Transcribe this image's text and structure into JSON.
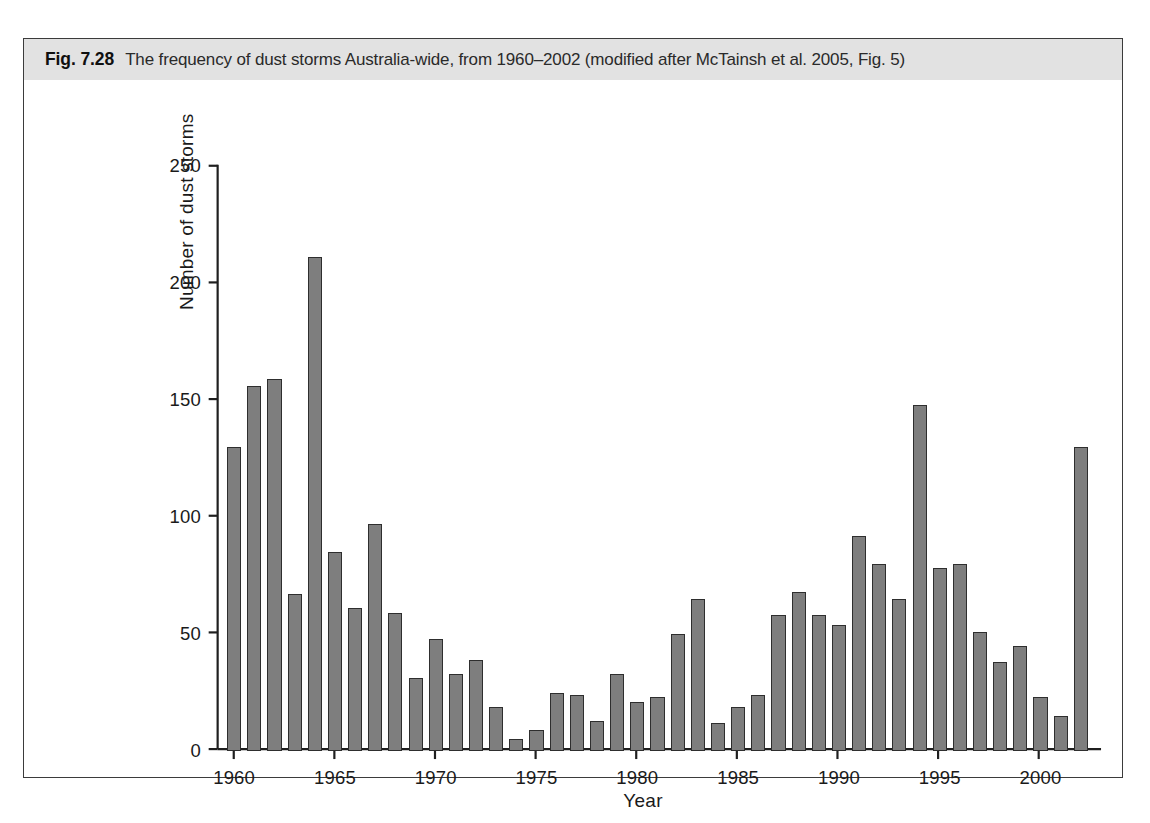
{
  "figure": {
    "number_label": "Fig. 7.28",
    "caption": "The frequency of dust storms Australia-wide, from 1960–2002 (modified after McTainsh et al. 2005, Fig. 5)",
    "band_color": "#e2e2e2",
    "border_color": "#3b3b3b"
  },
  "chart_data": {
    "type": "bar",
    "title": "",
    "xlabel": "Year",
    "ylabel": "Number of dust storms",
    "xlim": [
      1959.2,
      2002.8
    ],
    "ylim": [
      0,
      250
    ],
    "yticks": [
      0,
      50,
      100,
      150,
      200,
      250
    ],
    "ytick_labels": [
      "0",
      "50",
      "100",
      "150",
      "200",
      "250"
    ],
    "xticks": [
      1960,
      1965,
      1970,
      1975,
      1980,
      1985,
      1990,
      1995,
      2000
    ],
    "xtick_labels": [
      "1960",
      "1965",
      "1970",
      "1975",
      "1980",
      "1985",
      "1990",
      "1995",
      "2000"
    ],
    "grid": false,
    "legend": false,
    "bar_color": "#7e7e7e",
    "bar_edge_color": "#2e2e2e",
    "categories": [
      1960,
      1961,
      1962,
      1963,
      1964,
      1965,
      1966,
      1967,
      1968,
      1969,
      1970,
      1971,
      1972,
      1973,
      1974,
      1975,
      1976,
      1977,
      1978,
      1979,
      1980,
      1981,
      1982,
      1983,
      1984,
      1985,
      1986,
      1987,
      1988,
      1989,
      1990,
      1991,
      1992,
      1993,
      1994,
      1995,
      1996,
      1997,
      1998,
      1999,
      2000,
      2001,
      2002
    ],
    "values": [
      130,
      156,
      159,
      67,
      211,
      85,
      61,
      97,
      59,
      31,
      48,
      33,
      39,
      19,
      5,
      9,
      25,
      24,
      13,
      33,
      21,
      23,
      50,
      65,
      12,
      19,
      24,
      58,
      68,
      58,
      54,
      92,
      80,
      65,
      148,
      78,
      80,
      51,
      38,
      45,
      23,
      15,
      130
    ]
  }
}
